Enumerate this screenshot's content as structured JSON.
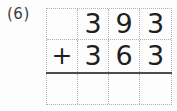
{
  "page": {
    "problem_number": "(6)"
  },
  "worksheet": {
    "type": "vertical-addition",
    "operator": "+",
    "rows": {
      "top": [
        "",
        "3",
        "9",
        "3"
      ],
      "bottom": [
        "+",
        "3",
        "6",
        "3"
      ],
      "answer": [
        "",
        "",
        "",
        ""
      ]
    }
  },
  "colors": {
    "digit": "#1f1f1f",
    "grid_dots": "#b0b0b0",
    "sum_line": "#4d4d4d",
    "background": "#fdfdfd"
  }
}
